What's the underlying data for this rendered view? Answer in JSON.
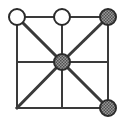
{
  "figure": {
    "title": "",
    "type": "graph-diagram",
    "width": 124,
    "height": 123,
    "background_color": "#ffffff"
  },
  "style": {
    "edge_color": "#3a3a3a",
    "edge_width": 2,
    "diagonal_width": 3,
    "node_stroke_color": "#2b2b2b",
    "node_stroke_width": 2,
    "node_radius": 8,
    "node_fill_empty": "#ffffff",
    "node_fill_shaded": "#8c8c8c",
    "hatch_color": "#4a4a4a"
  },
  "graph_data": {
    "type": "graph",
    "layout": "3x3-lattice-with-diagonals",
    "nodes": [
      {
        "id": "top-left",
        "label": "",
        "x": 17,
        "y": 17,
        "fill": "empty",
        "marked": true,
        "radius": 8
      },
      {
        "id": "top-center",
        "label": "",
        "x": 62,
        "y": 17,
        "fill": "empty",
        "marked": true,
        "radius": 8
      },
      {
        "id": "top-right",
        "label": "",
        "x": 108,
        "y": 17,
        "fill": "shaded",
        "marked": true,
        "radius": 8
      },
      {
        "id": "mid-left",
        "label": "",
        "x": 17,
        "y": 62,
        "fill": "none",
        "marked": false,
        "radius": 0
      },
      {
        "id": "center",
        "label": "",
        "x": 62,
        "y": 62,
        "fill": "shaded",
        "marked": true,
        "radius": 8
      },
      {
        "id": "mid-right",
        "label": "",
        "x": 108,
        "y": 62,
        "fill": "none",
        "marked": false,
        "radius": 0
      },
      {
        "id": "bottom-left",
        "label": "",
        "x": 17,
        "y": 108,
        "fill": "none",
        "marked": false,
        "radius": 0
      },
      {
        "id": "bottom-center",
        "label": "",
        "x": 62,
        "y": 108,
        "fill": "none",
        "marked": false,
        "radius": 0
      },
      {
        "id": "bottom-right",
        "label": "",
        "x": 108,
        "y": 108,
        "fill": "shaded",
        "marked": true,
        "radius": 8
      }
    ],
    "edges": [
      {
        "from": "top-left",
        "to": "top-center",
        "kind": "orthogonal"
      },
      {
        "from": "top-center",
        "to": "top-right",
        "kind": "orthogonal"
      },
      {
        "from": "mid-left",
        "to": "center",
        "kind": "orthogonal"
      },
      {
        "from": "center",
        "to": "mid-right",
        "kind": "orthogonal"
      },
      {
        "from": "bottom-left",
        "to": "bottom-center",
        "kind": "orthogonal"
      },
      {
        "from": "bottom-center",
        "to": "bottom-right",
        "kind": "orthogonal"
      },
      {
        "from": "top-left",
        "to": "mid-left",
        "kind": "orthogonal"
      },
      {
        "from": "mid-left",
        "to": "bottom-left",
        "kind": "orthogonal"
      },
      {
        "from": "top-center",
        "to": "center",
        "kind": "orthogonal"
      },
      {
        "from": "center",
        "to": "bottom-center",
        "kind": "orthogonal"
      },
      {
        "from": "top-right",
        "to": "mid-right",
        "kind": "orthogonal"
      },
      {
        "from": "mid-right",
        "to": "bottom-right",
        "kind": "orthogonal"
      },
      {
        "from": "top-left",
        "to": "center",
        "kind": "diagonal"
      },
      {
        "from": "center",
        "to": "bottom-right",
        "kind": "diagonal"
      },
      {
        "from": "top-right",
        "to": "center",
        "kind": "diagonal"
      },
      {
        "from": "center",
        "to": "bottom-left",
        "kind": "diagonal"
      }
    ]
  }
}
